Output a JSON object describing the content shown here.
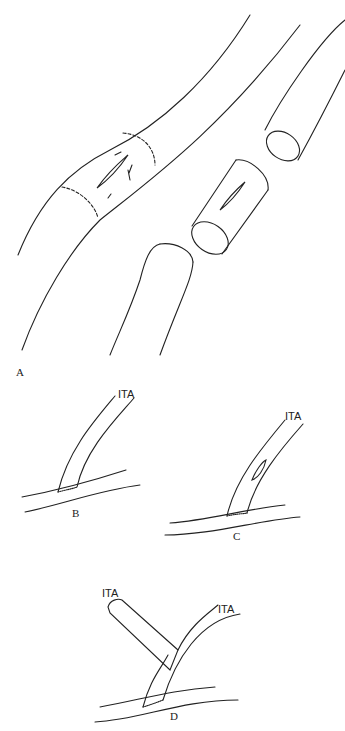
{
  "panels": {
    "a": {
      "label": "A"
    },
    "b": {
      "label": "B",
      "vessel_label": "ITA"
    },
    "c": {
      "label": "C",
      "vessel_label": "ITA"
    },
    "d": {
      "label": "D",
      "vessel_label_left": "ITA",
      "vessel_label_right": "ITA"
    }
  }
}
